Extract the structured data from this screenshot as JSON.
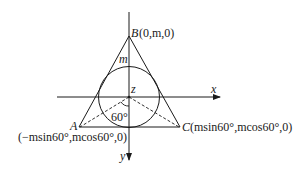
{
  "diagram": {
    "axes": {
      "x_label": "x",
      "y_label": "y",
      "z_label": "z"
    },
    "points": {
      "B": {
        "name": "B",
        "coords": "(0,m,0)"
      },
      "A": {
        "name": "A",
        "coords": "(−msin60°,mcos60°,0)"
      },
      "C": {
        "name": "C",
        "coords": "(msin60°,mcos60°,0)"
      }
    },
    "segment_label": "m",
    "angle_label": "60°",
    "colors": {
      "stroke": "#1a1a1a",
      "background": "#ffffff"
    }
  }
}
